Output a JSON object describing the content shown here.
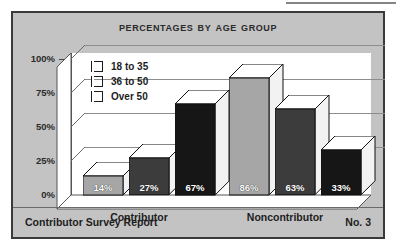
{
  "chart_data": {
    "type": "bar",
    "title": "Percentages by Age Group",
    "categories": [
      "Contributor",
      "Noncontributor"
    ],
    "series": [
      {
        "name": "18 to 35",
        "values": [
          14,
          27
        ],
        "color": "#a6a6a6"
      },
      {
        "name": "36 to 50",
        "values": [
          27,
          63
        ],
        "color": "#3c3c3c"
      },
      {
        "name": "Over 50",
        "values": [
          67,
          33
        ],
        "color": "#161616"
      }
    ],
    "bars": [
      {
        "group": "Contributor",
        "series": "18 to 35",
        "value": 14,
        "label": "14%",
        "color": "#a6a6a6"
      },
      {
        "group": "Contributor",
        "series": "36 to 50",
        "value": 27,
        "label": "27%",
        "color": "#3c3c3c"
      },
      {
        "group": "Contributor",
        "series": "Over 50",
        "value": 67,
        "label": "67%",
        "color": "#161616"
      },
      {
        "group": "Noncontributor",
        "series": "18 to 35",
        "value": 86,
        "label": "86%",
        "color": "#a6a6a6"
      },
      {
        "group": "Noncontributor",
        "series": "36 to 50",
        "value": 63,
        "label": "63%",
        "color": "#3c3c3c"
      },
      {
        "group": "Noncontributor",
        "series": "Over 50",
        "value": 33,
        "label": "33%",
        "color": "#161616"
      }
    ],
    "ylabel": "",
    "xlabel": "",
    "ylim": [
      0,
      100
    ],
    "yticks": [
      0,
      25,
      50,
      75,
      100
    ],
    "ytick_labels": [
      "0%",
      "25%",
      "50%",
      "75%",
      "100%"
    ],
    "grid": true,
    "legend_position": "upper-left-inside",
    "projection": "3d-isometric"
  },
  "legend": {
    "items": [
      {
        "label": "18 to 35",
        "color": "#a6a6a6"
      },
      {
        "label": "36 to 50",
        "color": "#3c3c3c"
      },
      {
        "label": "Over 50",
        "color": "#161616"
      }
    ]
  },
  "footer": {
    "left": "Contributor Survey Report",
    "right": "No. 3"
  },
  "colors": {
    "panel": "#c3c3c3",
    "border": "#3a3a3a",
    "plot_background": "#ffffff",
    "gridline": "#8d8d8d",
    "text": "#1d1d1d"
  }
}
